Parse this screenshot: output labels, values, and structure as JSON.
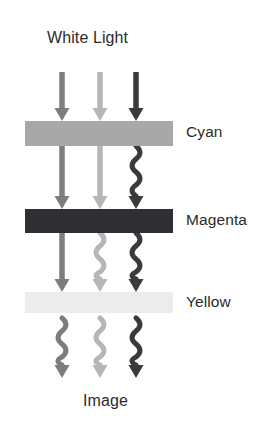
{
  "figure": {
    "title_top": "White Light",
    "title_bottom": "Image",
    "background_color": "#ffffff",
    "text_color": "#2b2b2b"
  },
  "labels": {
    "white_light": "White Light",
    "cyan": "Cyan",
    "magenta": "Magenta",
    "yellow": "Yellow",
    "image": "Image"
  },
  "chart_data": {
    "type": "diagram",
    "background": "#ffffff",
    "filters": [
      {
        "name": "Cyan",
        "label": "Cyan",
        "fill": "#a8a8a8",
        "x": 25,
        "y": 121,
        "width": 148,
        "height": 25
      },
      {
        "name": "Magenta",
        "label": "Magenta",
        "fill": "#2f2e32",
        "x": 25,
        "y": 209,
        "width": 148,
        "height": 24
      },
      {
        "name": "Yellow",
        "label": "Yellow",
        "fill": "#ececec",
        "x": 25,
        "y": 292,
        "width": 148,
        "height": 21
      }
    ],
    "rays": [
      {
        "name": "left-ray",
        "color": "#7d7d7d",
        "x": 62,
        "segments": [
          {
            "from_y": 72,
            "to_y": 121,
            "style": "straight",
            "arrowhead": true
          },
          {
            "from_y": 146,
            "to_y": 209,
            "style": "straight",
            "arrowhead": true
          },
          {
            "from_y": 233,
            "to_y": 292,
            "style": "straight",
            "arrowhead": true
          },
          {
            "from_y": 318,
            "to_y": 378,
            "style": "wavy",
            "arrowhead": true
          }
        ]
      },
      {
        "name": "middle-ray",
        "color": "#b6b6b6",
        "x": 100,
        "segments": [
          {
            "from_y": 72,
            "to_y": 121,
            "style": "straight",
            "arrowhead": true
          },
          {
            "from_y": 146,
            "to_y": 209,
            "style": "straight",
            "arrowhead": true
          },
          {
            "from_y": 233,
            "to_y": 292,
            "style": "wavy",
            "arrowhead": true
          },
          {
            "from_y": 318,
            "to_y": 378,
            "style": "wavy",
            "arrowhead": true
          }
        ]
      },
      {
        "name": "right-ray",
        "color": "#3a3a3a",
        "x": 136,
        "segments": [
          {
            "from_y": 72,
            "to_y": 121,
            "style": "straight",
            "arrowhead": true
          },
          {
            "from_y": 146,
            "to_y": 209,
            "style": "wavy",
            "arrowhead": true
          },
          {
            "from_y": 233,
            "to_y": 292,
            "style": "wavy",
            "arrowhead": true
          },
          {
            "from_y": 318,
            "to_y": 378,
            "style": "wavy",
            "arrowhead": true
          }
        ]
      }
    ],
    "label_positions": [
      {
        "text": "White Light",
        "x": 47,
        "y": 30,
        "align": "left"
      },
      {
        "text": "Cyan",
        "x": 186,
        "y": 124,
        "align": "left"
      },
      {
        "text": "Magenta",
        "x": 186,
        "y": 212,
        "align": "left"
      },
      {
        "text": "Yellow",
        "x": 186,
        "y": 294,
        "align": "left"
      },
      {
        "text": "Image",
        "x": 83,
        "y": 393,
        "align": "left"
      }
    ]
  }
}
